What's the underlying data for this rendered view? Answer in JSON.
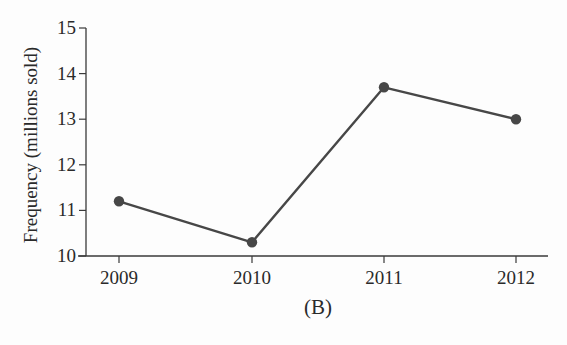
{
  "chart_data": {
    "type": "line",
    "title": "",
    "caption": "(B)",
    "xlabel": "",
    "ylabel": "Frequency (millions sold)",
    "categories": [
      "2009",
      "2010",
      "2011",
      "2012"
    ],
    "values": [
      11.2,
      10.3,
      13.7,
      13.0
    ],
    "series": [
      {
        "name": "Frequency (millions sold)",
        "values": [
          11.2,
          10.3,
          13.7,
          13.0
        ]
      }
    ],
    "ylim": [
      10,
      15
    ],
    "yticks": [
      10,
      11,
      12,
      13,
      14,
      15
    ],
    "grid": false,
    "legend": null,
    "markers": true
  },
  "colors": {
    "line": "#474747",
    "marker": "#474747",
    "axis": "#3a3a3a",
    "text": "#2a2a2a",
    "background": "#fdfdfd"
  }
}
